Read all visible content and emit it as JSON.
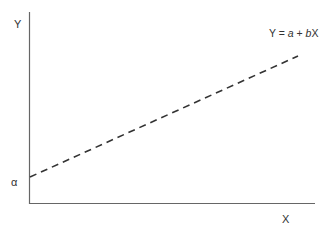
{
  "diagram": {
    "y_axis_label": "Y",
    "x_axis_label": "X",
    "intercept_label": "α",
    "equation": {
      "prefix": "Y = ",
      "a": "a",
      "mid": " + ",
      "b": "b",
      "suffix": "X"
    },
    "line_style": "dashed",
    "colors": {
      "axis": "#555555",
      "line": "#333333",
      "text": "#333333"
    }
  }
}
